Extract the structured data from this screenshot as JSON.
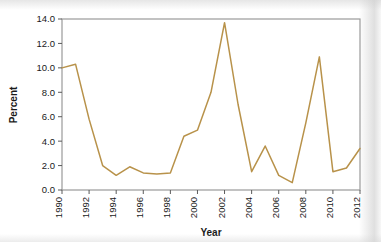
{
  "chart_data": {
    "type": "line",
    "title": "",
    "xlabel": "Year",
    "ylabel": "Percent",
    "xlim": [
      1990,
      2012
    ],
    "ylim": [
      0.0,
      14.0
    ],
    "grid": false,
    "legend": null,
    "xticks": [
      1990,
      1992,
      1994,
      1996,
      1998,
      2000,
      2002,
      2004,
      2006,
      2008,
      2010,
      2012
    ],
    "xtick_labels": [
      "1990",
      "1992",
      "1994",
      "1996",
      "1998",
      "2000",
      "2002",
      "2004",
      "2006",
      "2008",
      "2010",
      "2012"
    ],
    "yticks": [
      0.0,
      2.0,
      4.0,
      6.0,
      8.0,
      10.0,
      12.0,
      14.0
    ],
    "ytick_labels": [
      "0.0",
      "2.0",
      "4.0",
      "6.0",
      "8.0",
      "10.0",
      "12.0",
      "14.0"
    ],
    "line_color": "#b8924a",
    "x": [
      1990,
      1991,
      1992,
      1993,
      1994,
      1995,
      1996,
      1997,
      1998,
      1999,
      2000,
      2001,
      2002,
      2003,
      2004,
      2005,
      2006,
      2007,
      2008,
      2009,
      2010,
      2011,
      2012
    ],
    "values": [
      10.0,
      10.3,
      5.8,
      2.0,
      1.2,
      1.9,
      1.4,
      1.3,
      1.4,
      4.4,
      4.9,
      8.0,
      13.7,
      7.0,
      1.5,
      3.6,
      1.2,
      0.6,
      5.5,
      10.9,
      1.5,
      1.8,
      3.4
    ],
    "series": [
      {
        "name": "Percent",
        "values": [
          10.0,
          10.3,
          5.8,
          2.0,
          1.2,
          1.9,
          1.4,
          1.3,
          1.4,
          4.4,
          4.9,
          8.0,
          13.7,
          7.0,
          1.5,
          3.6,
          1.2,
          0.6,
          5.5,
          10.9,
          1.5,
          1.8,
          3.4
        ]
      }
    ]
  },
  "axis": {
    "frame_color": "#8c8c8c",
    "background": "#ffffff"
  }
}
